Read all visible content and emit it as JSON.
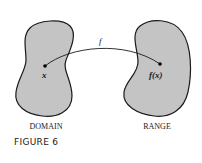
{
  "figure": {
    "caption": "FIGURE 6",
    "domain_label": "DOMAIN",
    "range_label": "RANGE",
    "function_label": "f",
    "input_label": "x",
    "output_label": "f(x)"
  },
  "colors": {
    "blob_fill": "#c4c4c4",
    "blob_stroke": "#1a1a1a",
    "curve": "#1a1a1a",
    "text": "#1a1a1a"
  }
}
